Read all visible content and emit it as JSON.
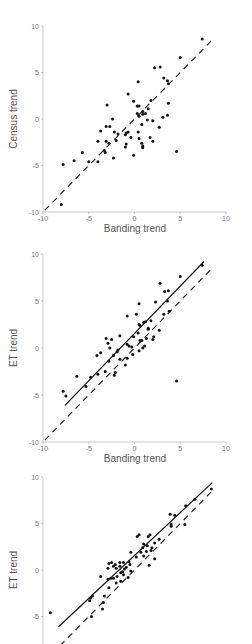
{
  "chart_data": [
    {
      "type": "scatter",
      "title": "",
      "xlabel": "Banding trend",
      "ylabel": "Census trend",
      "xlim": [
        -10,
        10
      ],
      "ylim": [
        -10,
        10
      ],
      "xticks": [
        "-10",
        "-5",
        "0",
        "5",
        "10"
      ],
      "yticks": [
        "10",
        "5",
        "0",
        "-5",
        "-10"
      ],
      "grid": false,
      "legend": null,
      "lines": [
        {
          "name": "1:1 line",
          "style": "dashed",
          "x": [
            -9.8,
            8.5
          ],
          "y": [
            -9.8,
            8.5
          ]
        }
      ],
      "series": [
        {
          "name": "species",
          "points": [
            [
              7.4,
              8.6
            ],
            [
              5.0,
              6.6
            ],
            [
              2.8,
              5.6
            ],
            [
              2.2,
              5.5
            ],
            [
              0.4,
              4.0
            ],
            [
              3.2,
              4.4
            ],
            [
              3.6,
              4.1
            ],
            [
              3.7,
              3.8
            ],
            [
              -0.7,
              2.7
            ],
            [
              -3.0,
              1.5
            ],
            [
              -0.1,
              1.9
            ],
            [
              0.3,
              1.4
            ],
            [
              0.5,
              1.4
            ],
            [
              1.8,
              2.0
            ],
            [
              1.5,
              1.1
            ],
            [
              3.7,
              1.7
            ],
            [
              0.9,
              0.8
            ],
            [
              1.2,
              0.6
            ],
            [
              0.3,
              0.6
            ],
            [
              0.5,
              0.3
            ],
            [
              0.9,
              0.5
            ],
            [
              -2.4,
              0.0
            ],
            [
              1.4,
              -0.1
            ],
            [
              2.0,
              -0.2
            ],
            [
              3.1,
              0.2
            ],
            [
              3.6,
              0.4
            ],
            [
              0.8,
              -0.6
            ],
            [
              2.7,
              -0.9
            ],
            [
              -3.1,
              -0.8
            ],
            [
              -2.7,
              -0.8
            ],
            [
              -3.7,
              -1.3
            ],
            [
              -0.7,
              -1.4
            ],
            [
              -0.9,
              -1.5
            ],
            [
              -1.0,
              -1.7
            ],
            [
              -1.8,
              -1.6
            ],
            [
              -2.2,
              -1.4
            ],
            [
              -0.4,
              -2.0
            ],
            [
              0.4,
              -1.4
            ],
            [
              0.5,
              -2.1
            ],
            [
              1.7,
              -2.0
            ],
            [
              2.0,
              -2.4
            ],
            [
              -3.1,
              -2.4
            ],
            [
              -2.8,
              -2.6
            ],
            [
              -4.0,
              -2.4
            ],
            [
              -2.0,
              -2.3
            ],
            [
              -0.9,
              -2.7
            ],
            [
              -1.0,
              -3.0
            ],
            [
              0.8,
              -2.6
            ],
            [
              0.9,
              -2.9
            ],
            [
              0.9,
              -3.1
            ],
            [
              -0.1,
              -3.9
            ],
            [
              -3.3,
              -3.4
            ],
            [
              -3.2,
              -3.6
            ],
            [
              -2.3,
              -4.2
            ],
            [
              -4.0,
              -4.6
            ],
            [
              -5.0,
              -4.6
            ],
            [
              -5.7,
              -3.6
            ],
            [
              -6.6,
              -4.5
            ],
            [
              -7.8,
              -4.9
            ],
            [
              -8.0,
              -9.2
            ],
            [
              4.6,
              -3.5
            ]
          ]
        }
      ]
    },
    {
      "type": "scatter",
      "title": "",
      "xlabel": "Banding trend",
      "ylabel": "ET trend",
      "xlim": [
        -10,
        10
      ],
      "ylim": [
        -10,
        10
      ],
      "xticks": [
        "-10",
        "-5",
        "0",
        "5",
        "10"
      ],
      "yticks": [
        "10",
        "5",
        "0",
        "-5",
        "-10"
      ],
      "grid": false,
      "legend": null,
      "lines": [
        {
          "name": "1:1 line",
          "style": "dashed",
          "x": [
            -9.8,
            8.5
          ],
          "y": [
            -9.8,
            8.5
          ]
        },
        {
          "name": "regression line",
          "style": "solid",
          "x": [
            -7.6,
            7.6
          ],
          "y": [
            -6.1,
            9.2
          ]
        }
      ],
      "series": [
        {
          "name": "species",
          "points": [
            [
              7.4,
              8.8
            ],
            [
              5.0,
              7.6
            ],
            [
              2.8,
              6.9
            ],
            [
              3.3,
              6.0
            ],
            [
              3.7,
              6.1
            ],
            [
              3.6,
              5.0
            ],
            [
              2.3,
              4.9
            ],
            [
              0.5,
              4.7
            ],
            [
              3.2,
              3.6
            ],
            [
              3.8,
              3.9
            ],
            [
              0.2,
              3.6
            ],
            [
              -0.8,
              3.4
            ],
            [
              0.5,
              2.5
            ],
            [
              0.6,
              2.4
            ],
            [
              1.0,
              2.7
            ],
            [
              1.2,
              2.8
            ],
            [
              1.8,
              2.9
            ],
            [
              1.5,
              2.1
            ],
            [
              1.5,
              2.0
            ],
            [
              2.7,
              1.9
            ],
            [
              0.4,
              1.6
            ],
            [
              -0.1,
              1.2
            ],
            [
              -1.6,
              1.3
            ],
            [
              0.8,
              0.8
            ],
            [
              1.3,
              1.0
            ],
            [
              2.0,
              0.9
            ],
            [
              2.1,
              1.2
            ],
            [
              0.6,
              0.8
            ],
            [
              -3.1,
              1.0
            ],
            [
              -2.5,
              0.9
            ],
            [
              -2.9,
              0.5
            ],
            [
              -2.7,
              0.0
            ],
            [
              -1.8,
              -0.2
            ],
            [
              -1.9,
              -0.4
            ],
            [
              -0.6,
              0.2
            ],
            [
              -0.8,
              0.4
            ],
            [
              -0.3,
              0.1
            ],
            [
              -0.2,
              -0.7
            ],
            [
              0.9,
              0.0
            ],
            [
              1.1,
              0.2
            ],
            [
              0.5,
              -0.3
            ],
            [
              -3.7,
              -0.5
            ],
            [
              -4.1,
              -0.8
            ],
            [
              -2.3,
              -0.8
            ],
            [
              -1.6,
              -1.2
            ],
            [
              -0.8,
              -1.1
            ],
            [
              -1.0,
              -1.8
            ],
            [
              -2.8,
              -1.4
            ],
            [
              -3.2,
              -2.5
            ],
            [
              -2.1,
              -2.6
            ],
            [
              -2.2,
              -2.9
            ],
            [
              -4.0,
              -2.8
            ],
            [
              -4.8,
              -3.1
            ],
            [
              -6.3,
              -3.0
            ],
            [
              -5.3,
              -4.1
            ],
            [
              -7.8,
              -4.6
            ],
            [
              -7.5,
              -5.1
            ],
            [
              4.6,
              -3.5
            ]
          ]
        }
      ]
    },
    {
      "type": "scatter",
      "title": "",
      "xlabel": "",
      "ylabel": "ET trend",
      "xlim": [
        -10,
        10
      ],
      "ylim": [
        -10,
        10
      ],
      "yticks": [
        "10",
        "5",
        "0",
        "-5"
      ],
      "grid": false,
      "legend": null,
      "lines": [
        {
          "name": "1:1 line",
          "style": "dashed",
          "x": [
            -9.8,
            8.5
          ],
          "y": [
            -9.8,
            8.5
          ]
        },
        {
          "name": "regression line",
          "style": "solid",
          "x": [
            -8.3,
            8.5
          ],
          "y": [
            -6.1,
            9.4
          ]
        }
      ],
      "series": [
        {
          "name": "species",
          "points": [
            [
              8.4,
              8.7
            ],
            [
              6.6,
              7.6
            ],
            [
              5.6,
              6.9
            ],
            [
              3.9,
              6.0
            ],
            [
              4.4,
              5.9
            ],
            [
              4.0,
              4.9
            ],
            [
              4.0,
              4.7
            ],
            [
              5.5,
              4.9
            ],
            [
              0.3,
              3.6
            ],
            [
              0.5,
              3.8
            ],
            [
              1.5,
              3.6
            ],
            [
              1.7,
              3.8
            ],
            [
              2.7,
              3.3
            ],
            [
              1.0,
              2.8
            ],
            [
              1.4,
              2.6
            ],
            [
              2.2,
              2.9
            ],
            [
              0.9,
              2.4
            ],
            [
              1.8,
              2.1
            ],
            [
              1.9,
              2.4
            ],
            [
              1.3,
              2.0
            ],
            [
              0.7,
              1.9
            ],
            [
              1.0,
              1.5
            ],
            [
              1.6,
              0.5
            ],
            [
              2.2,
              1.2
            ],
            [
              0.2,
              1.4
            ],
            [
              -0.4,
              1.9
            ],
            [
              -0.6,
              0.9
            ],
            [
              -0.5,
              0.6
            ],
            [
              -1.6,
              0.8
            ],
            [
              -2.1,
              0.6
            ],
            [
              -2.3,
              0.4
            ],
            [
              -1.6,
              0.4
            ],
            [
              -1.2,
              0.8
            ],
            [
              -0.9,
              0.3
            ],
            [
              -1.1,
              0.1
            ],
            [
              -2.5,
              0.8
            ],
            [
              -2.8,
              0.7
            ],
            [
              -2.9,
              0.2
            ],
            [
              -2.0,
              0.2
            ],
            [
              -1.5,
              -0.3
            ],
            [
              -1.9,
              -0.7
            ],
            [
              -2.3,
              -0.9
            ],
            [
              -2.6,
              -0.9
            ],
            [
              -2.9,
              -1.0
            ],
            [
              -1.2,
              -0.5
            ],
            [
              -0.7,
              -0.8
            ],
            [
              -1.5,
              -1.2
            ],
            [
              -2.0,
              -1.4
            ],
            [
              -1.3,
              -0.2
            ],
            [
              -0.4,
              -0.1
            ],
            [
              -3.7,
              -0.7
            ],
            [
              -2.8,
              -1.9
            ],
            [
              -3.3,
              -2.8
            ],
            [
              -4.6,
              -2.8
            ],
            [
              -4.8,
              -3.0
            ],
            [
              -4.9,
              -3.3
            ],
            [
              -3.4,
              -3.5
            ],
            [
              -3.5,
              -4.2
            ],
            [
              -4.7,
              -5.0
            ],
            [
              -9.2,
              -4.6
            ]
          ]
        }
      ]
    }
  ],
  "panels": [
    {
      "xlabel": "Banding trend",
      "ylabel": "Census trend",
      "yticks": [
        "10",
        "5",
        "0",
        "-5",
        "-10"
      ],
      "xticks": [
        "-10",
        "-5",
        "0",
        "5",
        "10"
      ]
    },
    {
      "xlabel": "Banding trend",
      "ylabel": "ET trend",
      "yticks": [
        "10",
        "5",
        "0",
        "-5",
        "-10"
      ],
      "xticks": [
        "-10",
        "-5",
        "0",
        "5",
        "10"
      ]
    },
    {
      "xlabel": "",
      "ylabel": "ET trend",
      "yticks": [
        "10",
        "5",
        "0",
        "-5"
      ],
      "xticks": []
    }
  ]
}
